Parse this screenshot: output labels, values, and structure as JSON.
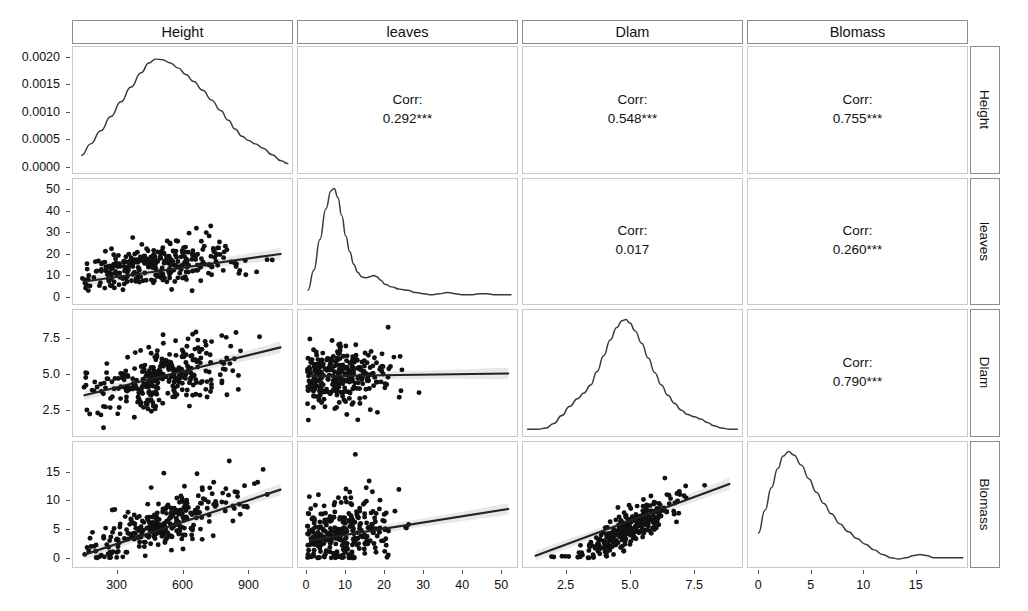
{
  "figure": {
    "type": "scatterplot-matrix",
    "variables": [
      "Height",
      "leaves",
      "Dlam",
      "Blomass"
    ],
    "column_headers": [
      "Height",
      "leaves",
      "Dlam",
      "Blomass"
    ],
    "row_labels": [
      "Height",
      "leaves",
      "Dlam",
      "Blomass"
    ],
    "corr_label": "Corr:",
    "n_points": 300
  },
  "chart_data": {
    "type": "scatter",
    "title": "",
    "xlabel": "",
    "ylabel": "",
    "grid": false,
    "legend": "none",
    "variables": [
      "Height",
      "leaves",
      "Dlam",
      "Blomass"
    ],
    "diagonal": "density",
    "upper": "correlation",
    "lower": "scatter-with-linear-fit",
    "axes": [
      {
        "var": "Height",
        "xlim": [
          120,
          1080
        ],
        "xticks": [
          300,
          600,
          900
        ],
        "xticklabels": [
          "300",
          "600",
          "900"
        ]
      },
      {
        "var": "leaves",
        "xlim": [
          -1,
          53
        ],
        "xticks": [
          0,
          10,
          20,
          30,
          40,
          50
        ],
        "xticklabels": [
          "0",
          "10",
          "20",
          "30",
          "40",
          "50"
        ]
      },
      {
        "var": "Dlam",
        "xlim": [
          1.0,
          9.2
        ],
        "xticks": [
          2.5,
          5.0,
          7.5
        ],
        "xticklabels": [
          "2.5",
          "5.0",
          "7.5"
        ]
      },
      {
        "var": "Blomass",
        "xlim": [
          -0.6,
          19.5
        ],
        "xticks": [
          0,
          5,
          10,
          15
        ],
        "xticklabels": [
          "0",
          "5",
          "10",
          "15"
        ]
      }
    ],
    "row_axes": [
      {
        "var": "Height",
        "ylim": [
          -5e-05,
          0.00212
        ],
        "yticks": [
          0.0,
          0.0005,
          0.001,
          0.0015,
          0.002
        ],
        "yticklabels": [
          "0.0000",
          "0.0005",
          "0.0010",
          "0.0015",
          "0.0020"
        ]
      },
      {
        "var": "leaves",
        "ylim": [
          -1.5,
          53
        ],
        "yticks": [
          0,
          10,
          20,
          30,
          40,
          50
        ],
        "yticklabels": [
          "0",
          "10",
          "20",
          "30",
          "40",
          "50"
        ]
      },
      {
        "var": "Dlam",
        "ylim": [
          1.0,
          9.2
        ],
        "yticks": [
          2.5,
          5.0,
          7.5
        ],
        "yticklabels": [
          "2.5",
          "5.0",
          "7.5"
        ]
      },
      {
        "var": "Blomass",
        "ylim": [
          -0.8,
          19.5
        ],
        "yticks": [
          0,
          5,
          10,
          15
        ],
        "yticklabels": [
          "0",
          "5",
          "10",
          "15"
        ]
      }
    ],
    "correlations": [
      {
        "row": "Height",
        "col": "leaves",
        "value": "0.292***"
      },
      {
        "row": "Height",
        "col": "Dlam",
        "value": "0.548***"
      },
      {
        "row": "Height",
        "col": "Blomass",
        "value": "0.755***"
      },
      {
        "row": "leaves",
        "col": "Dlam",
        "value": "0.017"
      },
      {
        "row": "leaves",
        "col": "Blomass",
        "value": "0.260***"
      },
      {
        "row": "Dlam",
        "col": "Blomass",
        "value": "0.790***"
      }
    ],
    "densities": [
      {
        "var": "Height",
        "xlim": [
          120,
          1080
        ],
        "ylim": [
          -5e-05,
          0.00212
        ],
        "points": [
          [
            150,
            0.00021
          ],
          [
            190,
            0.00042
          ],
          [
            235,
            0.00066
          ],
          [
            280,
            0.00092
          ],
          [
            325,
            0.00119
          ],
          [
            370,
            0.00146
          ],
          [
            415,
            0.00172
          ],
          [
            450,
            0.0019
          ],
          [
            480,
            0.00197
          ],
          [
            510,
            0.00196
          ],
          [
            545,
            0.0019
          ],
          [
            580,
            0.00181
          ],
          [
            615,
            0.00169
          ],
          [
            650,
            0.00156
          ],
          [
            690,
            0.0014
          ],
          [
            730,
            0.00122
          ],
          [
            770,
            0.00103
          ],
          [
            805,
            0.00085
          ],
          [
            835,
            0.00069
          ],
          [
            865,
            0.00056
          ],
          [
            895,
            0.00048
          ],
          [
            925,
            0.00042
          ],
          [
            960,
            0.00034
          ],
          [
            1000,
            0.00022
          ],
          [
            1040,
            0.00011
          ],
          [
            1070,
            6e-05
          ]
        ]
      },
      {
        "var": "leaves",
        "xlim": [
          -1,
          53
        ],
        "ylim": [
          0,
          1.05
        ],
        "points": [
          [
            1.0,
            0.1
          ],
          [
            2.5,
            0.28
          ],
          [
            4.0,
            0.55
          ],
          [
            5.5,
            0.82
          ],
          [
            6.8,
            0.98
          ],
          [
            7.6,
            1.0
          ],
          [
            8.5,
            0.92
          ],
          [
            9.5,
            0.76
          ],
          [
            10.5,
            0.58
          ],
          [
            11.5,
            0.44
          ],
          [
            12.5,
            0.33
          ],
          [
            13.5,
            0.26
          ],
          [
            14.5,
            0.22
          ],
          [
            15.5,
            0.21
          ],
          [
            16.5,
            0.22
          ],
          [
            17.5,
            0.23
          ],
          [
            18.3,
            0.22
          ],
          [
            19.2,
            0.19
          ],
          [
            20.5,
            0.15
          ],
          [
            22.0,
            0.13
          ],
          [
            24.0,
            0.11
          ],
          [
            26.0,
            0.1
          ],
          [
            28.0,
            0.08
          ],
          [
            30.0,
            0.07
          ],
          [
            32.0,
            0.06
          ],
          [
            34.0,
            0.07
          ],
          [
            36.0,
            0.08
          ],
          [
            38.0,
            0.07
          ],
          [
            40.0,
            0.06
          ],
          [
            42.0,
            0.06
          ],
          [
            44.0,
            0.07
          ],
          [
            46.0,
            0.07
          ],
          [
            48.0,
            0.06
          ],
          [
            50.0,
            0.06
          ],
          [
            52.0,
            0.06
          ]
        ]
      },
      {
        "var": "Dlam",
        "xlim": [
          1.0,
          9.2
        ],
        "ylim": [
          0,
          1.05
        ],
        "points": [
          [
            1.1,
            0.03
          ],
          [
            1.5,
            0.03
          ],
          [
            1.8,
            0.04
          ],
          [
            2.1,
            0.08
          ],
          [
            2.4,
            0.15
          ],
          [
            2.7,
            0.23
          ],
          [
            3.0,
            0.3
          ],
          [
            3.25,
            0.35
          ],
          [
            3.5,
            0.42
          ],
          [
            3.75,
            0.54
          ],
          [
            4.0,
            0.68
          ],
          [
            4.25,
            0.82
          ],
          [
            4.5,
            0.93
          ],
          [
            4.7,
            0.99
          ],
          [
            4.85,
            1.0
          ],
          [
            5.0,
            0.97
          ],
          [
            5.2,
            0.9
          ],
          [
            5.45,
            0.79
          ],
          [
            5.7,
            0.66
          ],
          [
            5.95,
            0.53
          ],
          [
            6.2,
            0.42
          ],
          [
            6.45,
            0.33
          ],
          [
            6.7,
            0.26
          ],
          [
            6.95,
            0.2
          ],
          [
            7.2,
            0.16
          ],
          [
            7.45,
            0.14
          ],
          [
            7.7,
            0.12
          ],
          [
            7.95,
            0.09
          ],
          [
            8.2,
            0.06
          ],
          [
            8.5,
            0.04
          ],
          [
            8.8,
            0.03
          ],
          [
            9.1,
            0.03
          ]
        ]
      },
      {
        "var": "Blomass",
        "xlim": [
          -0.6,
          19.5
        ],
        "ylim": [
          0,
          1.05
        ],
        "points": [
          [
            0.2,
            0.28
          ],
          [
            0.8,
            0.48
          ],
          [
            1.4,
            0.68
          ],
          [
            2.0,
            0.85
          ],
          [
            2.5,
            0.96
          ],
          [
            3.0,
            1.0
          ],
          [
            3.5,
            0.97
          ],
          [
            4.2,
            0.88
          ],
          [
            4.9,
            0.76
          ],
          [
            5.6,
            0.64
          ],
          [
            6.3,
            0.54
          ],
          [
            7.0,
            0.45
          ],
          [
            7.8,
            0.36
          ],
          [
            8.6,
            0.29
          ],
          [
            9.4,
            0.23
          ],
          [
            10.2,
            0.18
          ],
          [
            11.0,
            0.13
          ],
          [
            11.8,
            0.09
          ],
          [
            12.6,
            0.06
          ],
          [
            13.3,
            0.05
          ],
          [
            14.0,
            0.06
          ],
          [
            14.7,
            0.08
          ],
          [
            15.3,
            0.09
          ],
          [
            15.9,
            0.08
          ],
          [
            16.6,
            0.06
          ],
          [
            17.3,
            0.06
          ],
          [
            18.0,
            0.06
          ],
          [
            18.8,
            0.06
          ],
          [
            19.3,
            0.06
          ]
        ]
      }
    ],
    "scatters": [
      {
        "xvar": "Height",
        "yvar": "leaves",
        "xlim": [
          120,
          1080
        ],
        "ylim": [
          -1.5,
          53
        ],
        "fit": {
          "x0": 150,
          "y0": 7.0,
          "x1": 1050,
          "y1": 20.0
        },
        "cluster": {
          "xmode": 430,
          "xspread": 200,
          "ybase": 8.5,
          "yslope": 0.0125,
          "yspread": 4.5,
          "yskew": 2.6,
          "ymin": 0.5,
          "ymax": 52
        },
        "n": 300
      },
      {
        "xvar": "Height",
        "yvar": "Dlam",
        "xlim": [
          120,
          1080
        ],
        "ylim": [
          1.0,
          9.2
        ],
        "fit": {
          "x0": 150,
          "y0": 3.5,
          "x1": 1050,
          "y1": 6.9
        },
        "cluster": {
          "xmode": 450,
          "xspread": 200,
          "ybase": 3.0,
          "yslope": 0.0035,
          "yspread": 1.1,
          "yskew": 0.15,
          "ymin": 1.1,
          "ymax": 9.0
        },
        "n": 300
      },
      {
        "xvar": "Height",
        "yvar": "Blomass",
        "xlim": [
          120,
          1080
        ],
        "ylim": [
          -0.8,
          19.5
        ],
        "fit": {
          "x0": 150,
          "y0": 0.6,
          "x1": 1050,
          "y1": 12.0
        },
        "cluster": {
          "xmode": 450,
          "xspread": 200,
          "ybase": -1.2,
          "yslope": 0.0132,
          "yspread": 1.9,
          "yskew": 1.1,
          "ymin": 0.0,
          "ymax": 19.0
        },
        "n": 300
      },
      {
        "xvar": "leaves",
        "yvar": "Dlam",
        "xlim": [
          -1,
          53
        ],
        "ylim": [
          1.0,
          9.2
        ],
        "fit": {
          "x0": 1,
          "y0": 4.85,
          "x1": 52,
          "y1": 5.05
        },
        "cluster": {
          "xmode": 7,
          "xspread": 7,
          "ybase": 4.85,
          "yslope": 0.004,
          "yspread": 1.05,
          "yskew": 0.1,
          "ymin": 1.2,
          "ymax": 9.0
        },
        "n": 300
      },
      {
        "xvar": "leaves",
        "yvar": "Blomass",
        "xlim": [
          -1,
          53
        ],
        "ylim": [
          -0.8,
          19.5
        ],
        "fit": {
          "x0": 1,
          "y0": 3.1,
          "x1": 52,
          "y1": 8.6
        },
        "cluster": {
          "xmode": 7,
          "xspread": 7,
          "ybase": 3.0,
          "yslope": 0.085,
          "yspread": 2.6,
          "yskew": 1.4,
          "ymin": 0.0,
          "ymax": 19.0
        },
        "n": 300
      },
      {
        "xvar": "Dlam",
        "yvar": "Blomass",
        "xlim": [
          1.0,
          9.2
        ],
        "ylim": [
          -0.8,
          19.5
        ],
        "fit": {
          "x0": 1.3,
          "y0": 0.4,
          "x1": 8.9,
          "y1": 13.0
        },
        "cluster": {
          "xmode": 4.7,
          "xspread": 1.1,
          "ybase": -7.2,
          "yslope": 2.45,
          "yspread": 1.35,
          "yskew": 0.9,
          "ymin": 0.0,
          "ymax": 19.0
        },
        "n": 300
      }
    ]
  },
  "style": {
    "point_color": "#111111",
    "line_color": "#222222",
    "density_color": "#3a3a3a",
    "panel_border": "#c9c9c9",
    "strip_border": "#8c8c8c",
    "ribbon_color": "#bdbdbd"
  }
}
